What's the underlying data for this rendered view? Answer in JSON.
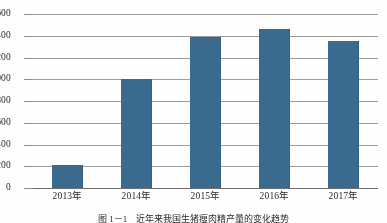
{
  "chart_data": {
    "type": "bar",
    "title": "",
    "xlabel": "",
    "ylabel": "",
    "categories": [
      "2013年",
      "2014年",
      "2015年",
      "2016年",
      "2017年"
    ],
    "values": [
      210,
      1000,
      1390,
      1460,
      1355
    ],
    "series": [
      {
        "name": "",
        "values": [
          210,
          1000,
          1390,
          1460,
          1355
        ]
      }
    ],
    "ylim": [
      0,
      1600
    ],
    "ytick_values": [
      0,
      200,
      400,
      600,
      800,
      1000,
      1200,
      1400,
      1600
    ],
    "ytick_labels": [
      "0",
      "200",
      "400",
      "600",
      "800",
      "1000",
      "1200",
      "1400",
      "1600"
    ],
    "grid": "horizontal",
    "legend": "none",
    "bar_color": "#3a6b8f",
    "gridline_color": "#8d8d8d",
    "axis_color": "#6e6e6e"
  },
  "caption": {
    "text": "图 1－1　近年来我国生猪瘦肉精产量的变化趋势"
  }
}
